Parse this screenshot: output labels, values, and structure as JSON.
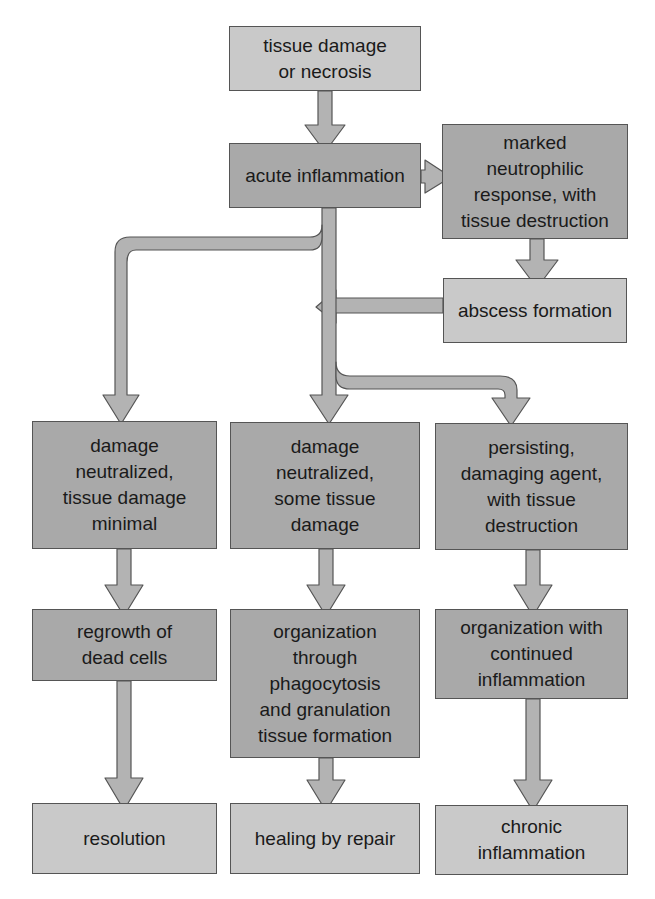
{
  "diagram": {
    "type": "flowchart",
    "colors": {
      "dark_box": "#a9a9a9",
      "light_box": "#c9c9c9",
      "arrow": "#b0b0b0",
      "outline": "#555555"
    },
    "nodes": {
      "tissue_damage": "tissue damage\nor necrosis",
      "acute_inflammation": "acute inflammation",
      "marked_neutrophilic": "marked\nneutrophilic\nresponse, with\ntissue destruction",
      "abscess_formation": "abscess formation",
      "damage_minimal": "damage\nneutralized,\ntissue damage\nminimal",
      "some_tissue_damage": "damage\nneutralized,\nsome tissue\ndamage",
      "persisting_agent": "persisting,\ndamaging agent,\nwith tissue\ndestruction",
      "regrowth": "regrowth of\ndead cells",
      "organization_phagocytosis": "organization\nthrough\nphagocytosis\nand granulation\ntissue formation",
      "organization_continued": "organization with\ncontinued\ninflammation",
      "resolution": "resolution",
      "healing_by_repair": "healing by repair",
      "chronic_inflammation": "chronic\ninflammation"
    },
    "edges": [
      [
        "tissue_damage",
        "acute_inflammation"
      ],
      [
        "acute_inflammation",
        "marked_neutrophilic"
      ],
      [
        "marked_neutrophilic",
        "abscess_formation"
      ],
      [
        "abscess_formation",
        "acute_inflammation"
      ],
      [
        "acute_inflammation",
        "damage_minimal"
      ],
      [
        "acute_inflammation",
        "some_tissue_damage"
      ],
      [
        "acute_inflammation",
        "persisting_agent"
      ],
      [
        "damage_minimal",
        "regrowth"
      ],
      [
        "some_tissue_damage",
        "organization_phagocytosis"
      ],
      [
        "persisting_agent",
        "organization_continued"
      ],
      [
        "regrowth",
        "resolution"
      ],
      [
        "organization_phagocytosis",
        "healing_by_repair"
      ],
      [
        "organization_continued",
        "chronic_inflammation"
      ]
    ]
  }
}
